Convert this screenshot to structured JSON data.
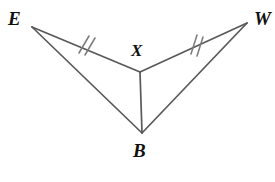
{
  "figure": {
    "type": "geometry-diagram",
    "background_color": "#ffffff",
    "stroke_color": "#595959",
    "tick_color": "#7a7a7a",
    "label_color": "#101010",
    "canvas": {
      "width": 275,
      "height": 182
    }
  },
  "vertices": [
    {
      "id": "E",
      "label": "E",
      "x": 32,
      "y": 27,
      "label_x": 17,
      "label_y": 19
    },
    {
      "id": "W",
      "label": "W",
      "x": 247,
      "y": 23,
      "label_x": 264,
      "label_y": 19
    },
    {
      "id": "X",
      "label": "X",
      "x": 140,
      "y": 72,
      "label_x": 139,
      "label_y": 52
    },
    {
      "id": "B",
      "label": "B",
      "x": 142,
      "y": 133,
      "label_x": 142,
      "label_y": 152
    }
  ],
  "segments": [
    {
      "id": "EX",
      "from": "E",
      "to": "X",
      "x1": 32,
      "y1": 27,
      "x2": 140,
      "y2": 72,
      "ticks": 2
    },
    {
      "id": "XW",
      "from": "X",
      "to": "W",
      "x1": 140,
      "y1": 72,
      "x2": 247,
      "y2": 23,
      "ticks": 2
    },
    {
      "id": "XB",
      "from": "X",
      "to": "B",
      "x1": 140,
      "y1": 72,
      "x2": 142,
      "y2": 133,
      "ticks": 0
    },
    {
      "id": "EB",
      "from": "E",
      "to": "B",
      "x1": 32,
      "y1": 27,
      "x2": 142,
      "y2": 133,
      "ticks": 0
    },
    {
      "id": "BW",
      "from": "B",
      "to": "W",
      "x1": 142,
      "y1": 133,
      "x2": 247,
      "y2": 23,
      "ticks": 0
    }
  ],
  "tick_marks": [
    {
      "id": "ticks-EX",
      "on_segment": "EX",
      "count": 2,
      "center_x": 86,
      "center_y": 45
    },
    {
      "id": "ticks-XW",
      "on_segment": "XW",
      "count": 2,
      "center_x": 197,
      "center_y": 45
    }
  ],
  "labels": {
    "E": "E",
    "W": "W",
    "X": "X",
    "B": "B"
  }
}
